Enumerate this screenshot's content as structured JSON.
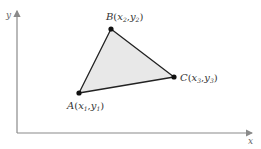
{
  "diagram": {
    "axes": {
      "x_label": "x",
      "y_label": "y",
      "color": "#8a8a8a"
    },
    "triangle": {
      "fill": "#e8e8e8",
      "stroke": "#222222",
      "vertices": [
        {
          "name": "A",
          "label": "A",
          "sub_x": "1",
          "sub_y": "1",
          "x": 79,
          "y": 93
        },
        {
          "name": "B",
          "label": "B",
          "sub_x": "2",
          "sub_y": "2",
          "x": 111,
          "y": 29
        },
        {
          "name": "C",
          "label": "C",
          "sub_x": "3",
          "sub_y": "3",
          "x": 174,
          "y": 77
        }
      ]
    },
    "labels": {
      "A": {
        "point": "A",
        "open": "(",
        "x": "x",
        "xs": "1",
        "comma": ",",
        "y": "y",
        "ys": "1",
        "close": ")"
      },
      "B": {
        "point": "B",
        "open": "(",
        "x": "x",
        "xs": "2",
        "comma": ",",
        "y": "y",
        "ys": "2",
        "close": ")"
      },
      "C": {
        "point": "C",
        "open": "(",
        "x": "x",
        "xs": "3",
        "comma": ",",
        "y": "y",
        "ys": "3",
        "close": ")"
      }
    }
  }
}
